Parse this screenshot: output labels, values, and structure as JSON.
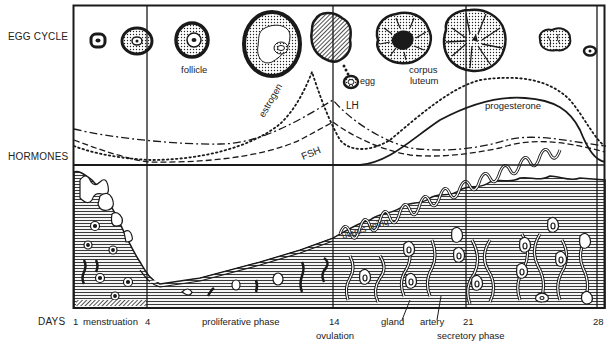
{
  "rows": {
    "egg_cycle": "EGG CYCLE",
    "hormones": "HORMONES",
    "days": "DAYS"
  },
  "egg_labels": {
    "follicle": "follicle",
    "egg": "egg",
    "corpus_luteum_line1": "corpus",
    "corpus_luteum_line2": "luteum"
  },
  "hormone_labels": {
    "estrogen": "estrogen",
    "lh": "LH",
    "fsh": "FSH",
    "progesterone": "progesterone"
  },
  "uterus_labels": {
    "uterus_lining": "uterus lining",
    "gland": "gland",
    "artery": "artery"
  },
  "day_axis": {
    "ticks": [
      {
        "day": "1",
        "phase": "menstruation"
      },
      {
        "day": "4"
      },
      {
        "day": "14"
      },
      {
        "day": "21"
      },
      {
        "day": "28"
      }
    ],
    "phases": {
      "menstruation": "menstruation",
      "proliferative": "proliferative phase",
      "ovulation": "ovulation",
      "secretory": "secretory phase"
    },
    "day_1": "1",
    "day_4": "4",
    "day_14": "14",
    "day_21": "21",
    "day_28": "28"
  },
  "hormone_curves": [
    {
      "name": "estrogen",
      "style": "dotted",
      "peak_day": 13,
      "second_peak_day": 22
    },
    {
      "name": "LH",
      "style": "dash-dot",
      "peak_day": 14
    },
    {
      "name": "FSH",
      "style": "dashed",
      "peak_day": 14
    },
    {
      "name": "progesterone",
      "style": "solid",
      "peak_day": 22
    }
  ],
  "colors": {
    "ink": "#1a1a1a",
    "background": "#ffffff",
    "hatch": "#3a3a3a"
  }
}
